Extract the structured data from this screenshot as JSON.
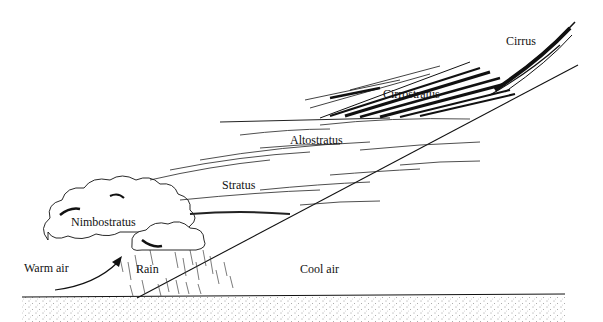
{
  "diagram": {
    "type": "warm front cloud sequence",
    "labels": {
      "cirrus": "Cirrus",
      "cirrostratus": "Cirrostratus",
      "altostratus": "Altostratus",
      "stratus": "Stratus",
      "nimbostratus": "Nimbostratus",
      "rain": "Rain",
      "warm_air": "Warm air",
      "cool_air": "Cool air"
    },
    "colors": {
      "ink": "#111111",
      "background": "#ffffff"
    }
  }
}
